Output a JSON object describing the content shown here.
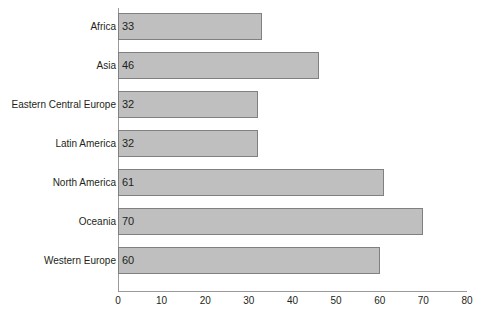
{
  "chart_data": {
    "type": "bar",
    "orientation": "horizontal",
    "title": "",
    "subtitle": "",
    "xlabel": "",
    "ylabel": "",
    "categories": [
      "Africa",
      "Asia",
      "Eastern Central Europe",
      "Latin America",
      "North America",
      "Oceania",
      "Western Europe"
    ],
    "values": [
      33,
      46,
      32,
      32,
      61,
      70,
      60
    ],
    "value_labels": [
      "33",
      "46",
      "32",
      "32",
      "61",
      "70",
      "60"
    ],
    "xlim": [
      0,
      80
    ],
    "xticks": [
      0,
      10,
      20,
      30,
      40,
      50,
      60,
      70,
      80
    ],
    "xtick_labels": [
      "0",
      "10",
      "20",
      "30",
      "40",
      "50",
      "60",
      "70",
      "80"
    ],
    "grid": false,
    "legend": false,
    "legend_position": "none",
    "bar_fill_color": "#bfbfbf",
    "bar_border_color": "#808080",
    "axis_color": "#9a9a9a",
    "text_color": "#231f20",
    "background_color": "#ffffff"
  }
}
